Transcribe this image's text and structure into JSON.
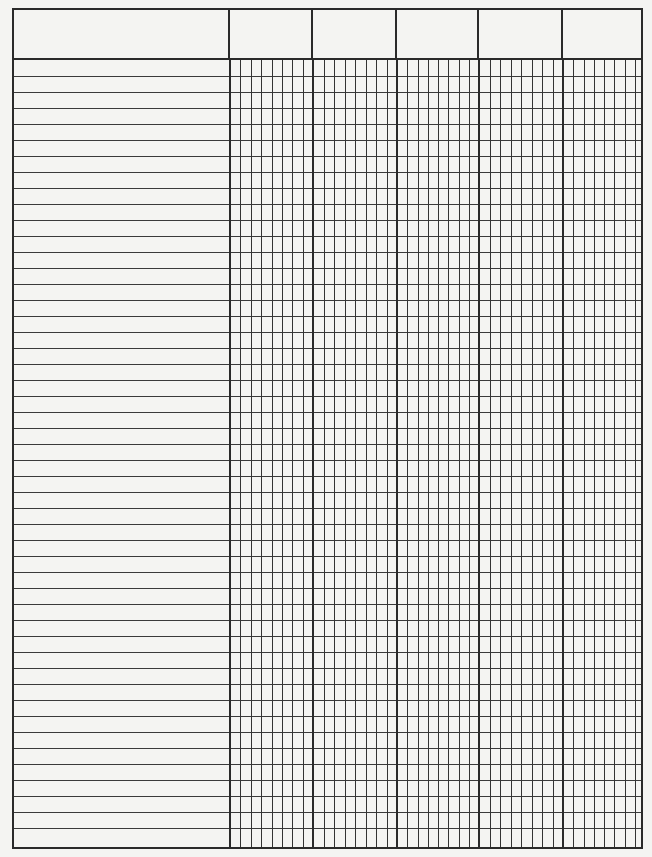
{
  "document": {
    "type": "blank ledger / columnar form sheet",
    "header": {
      "cells": [
        {
          "label": ""
        },
        {
          "label": ""
        },
        {
          "label": ""
        },
        {
          "label": ""
        },
        {
          "label": ""
        },
        {
          "label": ""
        }
      ]
    },
    "layout": {
      "description_column_width": 216,
      "data_columns": 5,
      "subdivisions_per_data_column": 8,
      "data_column_widths": [
        83,
        84,
        82,
        84,
        82
      ],
      "row_count": 49,
      "row_height": 16,
      "header_height": 50
    },
    "colors": {
      "paper": "#f4f4f2",
      "rule_line": "#2a2a2a"
    }
  }
}
